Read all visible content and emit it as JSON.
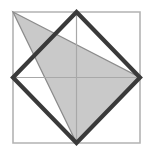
{
  "figure": {
    "canvas": {
      "width": 152,
      "height": 155,
      "background": "#ffffff"
    },
    "colors": {
      "square_border": "#b3b3b3",
      "median_line": "#a8a8a8",
      "rhombus_stroke": "#3a3a3a",
      "triangle_fill": "#c9c9c9",
      "triangle_stroke": "#8c8c8c"
    },
    "stroke_widths": {
      "square_border": 1.6,
      "median_line": 1.2,
      "rhombus_stroke": 4.2,
      "triangle_stroke": 1.3
    },
    "points": {
      "square_top_left": "13,12",
      "square_top_right": "140,12",
      "square_bottom_right": "140,143",
      "square_bottom_left": "13,143",
      "mid_top": "76.5,12",
      "mid_right": "140,77.5",
      "mid_bottom": "76.5,143",
      "mid_left": "13,77.5",
      "center": "76.5,77.5"
    },
    "shapes": {
      "square_outline": "13,12 140,12 140,143 13,143",
      "median_horizontal": {
        "x1": 13,
        "y1": 77.5,
        "x2": 140,
        "y2": 77.5
      },
      "median_vertical": {
        "x1": 76.5,
        "y1": 12,
        "x2": 76.5,
        "y2": 143
      },
      "rhombus": "76.5,12 140,77.5 76.5,143 13,77.5",
      "shaded_triangle": "13,12 140,77.5 76.5,143"
    },
    "labels": {
      "square": "outer-square",
      "rhombus": "inscribed-rhombus",
      "triangle": "shaded-triangle",
      "medians": "median-lines"
    }
  }
}
